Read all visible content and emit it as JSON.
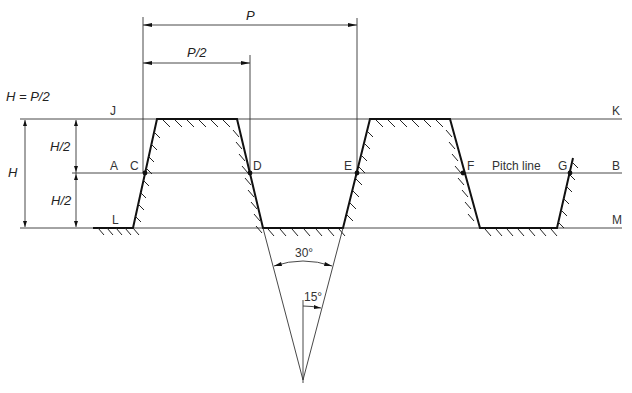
{
  "diagram": {
    "formula": "H = P/2",
    "dimensions": {
      "pitch": "P",
      "half_pitch": "P/2",
      "height": "H",
      "upper_half_height": "H/2",
      "lower_half_height": "H/2",
      "included_angle": "30°",
      "flank_angle": "15°"
    },
    "line_labels": {
      "crest_left": "J",
      "crest_right": "K",
      "pitch_left": "A",
      "pitch_right": "B",
      "root_left": "L",
      "root_right": "M",
      "pitch_line": "Pitch line"
    },
    "points": [
      "C",
      "D",
      "E",
      "F",
      "G"
    ],
    "angles_deg": {
      "included": 30,
      "flank": 15
    },
    "relations": [
      "H = P/2",
      "AC... points on pitch line separated by P/2"
    ]
  }
}
